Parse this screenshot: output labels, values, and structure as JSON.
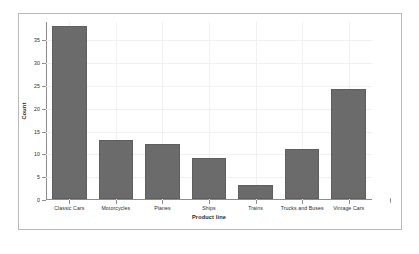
{
  "chart_data": {
    "type": "bar",
    "title": "",
    "subtitle": "",
    "xlabel": "Product line",
    "ylabel": "Count",
    "categories": [
      "Classic Cars",
      "Motorcycles",
      "Planes",
      "Ships",
      "Trains",
      "Trucks and Buses",
      "Vintage Cars"
    ],
    "values": [
      38,
      13,
      12,
      9,
      3,
      11,
      24
    ],
    "ylim": [
      0,
      39
    ],
    "yticks": [
      0,
      5,
      10,
      15,
      20,
      25,
      30,
      35
    ],
    "ytick_labels": [
      "0",
      "5",
      "10",
      "15",
      "20",
      "25",
      "30",
      "35"
    ],
    "grid": true,
    "legend": false,
    "bar_color": "#6b6b6b",
    "grid_color": "#f0f0f0",
    "axis_color": "#8c8c8c",
    "background": "#ffffff",
    "frame_color": "#b9b9b9"
  }
}
